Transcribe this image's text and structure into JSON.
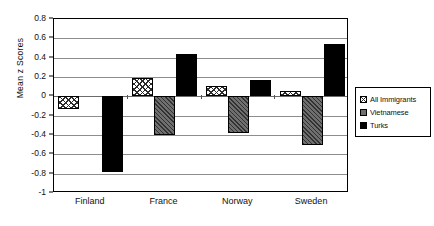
{
  "chart_data": {
    "type": "bar",
    "title": "",
    "xlabel": "",
    "ylabel": "Mean z Scores",
    "categories": [
      "Finland",
      "France",
      "Norway",
      "Sweden"
    ],
    "ylim": [
      -1,
      0.8
    ],
    "yticks": [
      0.8,
      0.6,
      0.4,
      0.2,
      0,
      -0.2,
      -0.4,
      -0.6,
      -0.8,
      -1
    ],
    "ytick_labels": [
      "0.8",
      "0.6",
      "0.4",
      "0.2",
      "0",
      "-0.2",
      "-0.4",
      "-0.6",
      "-0.8",
      "-1"
    ],
    "grid": true,
    "legend_position": "right",
    "series": [
      {
        "name": "All Immigrants",
        "swatch": "hatched-light",
        "color": "#ffffff",
        "values": [
          -0.13,
          0.19,
          0.11,
          0.055
        ]
      },
      {
        "name": "Vietnamese",
        "swatch": "gray",
        "color": "#6f6f6f",
        "values": [
          null,
          -0.4,
          -0.38,
          -0.5
        ]
      },
      {
        "name": "Turks",
        "swatch": "black",
        "color": "#000000",
        "values": [
          -0.78,
          0.44,
          0.17,
          0.54
        ]
      }
    ]
  }
}
